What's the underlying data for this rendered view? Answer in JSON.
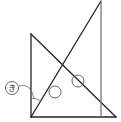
{
  "diagram": {
    "type": "geometry",
    "colors": {
      "line": "#222222",
      "vertical_edge": "#777777",
      "marks": "#555555"
    },
    "triangle_left": {
      "points": [
        [
          31,
          34
        ],
        [
          31,
          117
        ],
        [
          116,
          117
        ]
      ]
    },
    "triangle_tall": {
      "points": [
        [
          31,
          117
        ],
        [
          101,
          1
        ],
        [
          101,
          117
        ]
      ]
    },
    "angle_markers": [
      {
        "center": [
          55,
          92
        ],
        "r": 6
      },
      {
        "center": [
          78,
          81
        ],
        "r": 6
      }
    ],
    "angle_label": {
      "text": "き",
      "center": [
        12,
        88
      ],
      "r": 6.5
    }
  }
}
